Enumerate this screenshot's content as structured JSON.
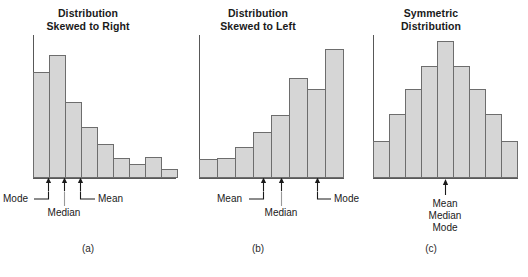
{
  "figure": {
    "background": "#ffffff",
    "bar_fill": "#d6d6d6",
    "bar_stroke": "#6d6d6d",
    "axis_color": "#585858"
  },
  "chart_data": [
    {
      "type": "bar",
      "panel": "a",
      "title": "Distribution\nSkewed to Right",
      "caption": "(a)",
      "categories": [
        "1",
        "2",
        "3",
        "4",
        "5",
        "6",
        "7",
        "8",
        "9"
      ],
      "values": [
        74,
        86,
        53,
        36,
        24,
        14,
        10,
        15,
        6
      ],
      "ylim": [
        0,
        100
      ],
      "xlabel": "",
      "ylabel": "",
      "grid": false,
      "annotations": [
        {
          "label": "Mode",
          "bar_index": 1,
          "arrow": true
        },
        {
          "label": "Median",
          "bar_index": 2,
          "arrow": true
        },
        {
          "label": "Mean",
          "bar_index": 3,
          "arrow": true
        }
      ]
    },
    {
      "type": "bar",
      "panel": "b",
      "title": "Distribution\nSkewed to Left",
      "caption": "(b)",
      "categories": [
        "1",
        "2",
        "3",
        "4",
        "5",
        "6",
        "7",
        "8"
      ],
      "values": [
        13,
        14,
        22,
        32,
        44,
        70,
        62,
        90
      ],
      "ylim": [
        0,
        100
      ],
      "xlabel": "",
      "ylabel": "",
      "grid": false,
      "annotations": [
        {
          "label": "Mean",
          "bar_index": 4,
          "arrow": true
        },
        {
          "label": "Median",
          "bar_index": 5,
          "arrow": true
        },
        {
          "label": "Mode",
          "bar_index": 7,
          "arrow": true
        }
      ]
    },
    {
      "type": "bar",
      "panel": "c",
      "title": "Symmetric\nDistribution",
      "caption": "(c)",
      "categories": [
        "1",
        "2",
        "3",
        "4",
        "5",
        "6",
        "7",
        "8",
        "9"
      ],
      "values": [
        26,
        45,
        62,
        78,
        96,
        78,
        62,
        45,
        26
      ],
      "ylim": [
        0,
        100
      ],
      "xlabel": "",
      "ylabel": "",
      "grid": false,
      "annotations": [
        {
          "label": "Mean\nMedian\nMode",
          "bar_index": 4,
          "arrow": true
        }
      ]
    }
  ],
  "panels": {
    "a": {
      "title": "Distribution\nSkewed to Right",
      "caption": "(a)",
      "labels": {
        "mode": "Mode",
        "median": "Median",
        "mean": "Mean"
      }
    },
    "b": {
      "title": "Distribution\nSkewed to Left",
      "caption": "(b)",
      "labels": {
        "mean": "Mean",
        "median": "Median",
        "mode": "Mode"
      }
    },
    "c": {
      "title": "Symmetric\nDistribution",
      "caption": "(c)",
      "labels": {
        "stacked": "Mean\nMedian\nMode"
      }
    }
  }
}
